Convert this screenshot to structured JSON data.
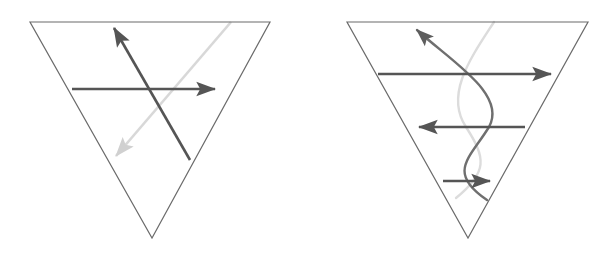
{
  "figure": {
    "background_color": "#ffffff",
    "width": 614,
    "height": 253,
    "panel_count": 2
  },
  "colors": {
    "triangle_outline": "#6b6b6b",
    "arrow_dark": "#555555",
    "arrow_mid": "#777777",
    "arrow_light": "#d8d8d8",
    "curve_dark": "#6f6f6f",
    "curve_light": "#dcdcdc",
    "background": "#ffffff"
  },
  "panels": [
    {
      "name": "left-panel",
      "label": "Left diagram",
      "triangle": {
        "name": "inverted-triangle",
        "orientation": "apex-down",
        "vertices": [
          {
            "x": 30,
            "y": 22
          },
          {
            "x": 270,
            "y": 22
          },
          {
            "x": 152,
            "y": 238
          }
        ],
        "stroke_width": 1.2
      },
      "arrows": [
        {
          "name": "horizontal-right-arrow",
          "direction": "right",
          "shade": "dark",
          "from": {
            "x": 72,
            "y": 89
          },
          "to": {
            "x": 222,
            "y": 89
          },
          "stroke_width": 2.6
        },
        {
          "name": "diagonal-up-left-arrow",
          "direction": "up-left",
          "shade": "dark",
          "from": {
            "x": 190,
            "y": 160
          },
          "to": {
            "x": 112,
            "y": 24
          },
          "stroke_width": 2.6
        },
        {
          "name": "diagonal-down-left-arrow",
          "direction": "down-left",
          "shade": "light",
          "from": {
            "x": 231,
            "y": 22
          },
          "to": {
            "x": 112,
            "y": 160
          },
          "stroke_width": 2.6
        }
      ],
      "intersection": {
        "x": 152,
        "y": 89
      }
    },
    {
      "name": "right-panel",
      "label": "Right diagram",
      "triangle": {
        "name": "inverted-triangle",
        "orientation": "apex-down",
        "vertices": [
          {
            "x": 347,
            "y": 22
          },
          {
            "x": 588,
            "y": 22
          },
          {
            "x": 468,
            "y": 238
          }
        ],
        "stroke_width": 1.2
      },
      "arrows": [
        {
          "name": "top-horizontal-right-arrow",
          "direction": "right",
          "shade": "dark",
          "from": {
            "x": 378,
            "y": 74
          },
          "to": {
            "x": 558,
            "y": 74
          },
          "stroke_width": 2.6
        },
        {
          "name": "middle-horizontal-left-arrow",
          "direction": "left",
          "shade": "dark",
          "from": {
            "x": 525,
            "y": 127
          },
          "to": {
            "x": 412,
            "y": 127
          },
          "stroke_width": 2.6
        },
        {
          "name": "bottom-horizontal-right-arrow",
          "direction": "right",
          "shade": "dark",
          "from": {
            "x": 443,
            "y": 181
          },
          "to": {
            "x": 497,
            "y": 181
          },
          "stroke_width": 2.6
        },
        {
          "name": "curve-up-arrow",
          "direction": "up",
          "shade": "dark",
          "from": {
            "x": 487,
            "y": 200
          },
          "to": {
            "x": 414,
            "y": 26
          },
          "stroke_width": 2.6
        }
      ],
      "curves": [
        {
          "name": "dark-sine-curve",
          "shade": "dark",
          "path": "M 414 26 C 455 70, 505 92, 487 127 C 470 160, 445 170, 487 200",
          "stroke_width": 2.4
        },
        {
          "name": "light-sine-curve",
          "shade": "light",
          "path": "M 494 22 C 470 58, 443 92, 463 127 C 482 162, 486 172, 455 200",
          "stroke_width": 2.4
        }
      ],
      "crossings": [
        {
          "x": 468,
          "y": 74
        },
        {
          "x": 468,
          "y": 127
        },
        {
          "x": 468,
          "y": 181
        }
      ]
    }
  ]
}
